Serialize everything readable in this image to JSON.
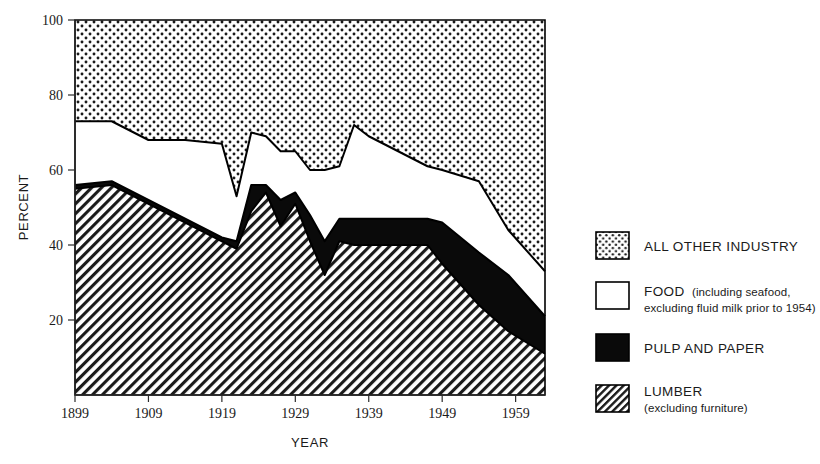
{
  "chart_data": {
    "type": "area",
    "stacked": true,
    "stack_total": 100,
    "title": "",
    "subtitle": "",
    "xlabel": "YEAR",
    "ylabel": "PERCENT",
    "xlim": [
      1899,
      1963
    ],
    "ylim": [
      0,
      100
    ],
    "xticks": [
      1899,
      1909,
      1919,
      1929,
      1939,
      1949,
      1959
    ],
    "xtick_labels": [
      "1899",
      "1909",
      "1919",
      "1929",
      "1939",
      "1949",
      "1959"
    ],
    "yticks": [
      20,
      40,
      60,
      80,
      100
    ],
    "ytick_labels": [
      "20",
      "40",
      "60",
      "80",
      "100"
    ],
    "grid": false,
    "legend_position": "right",
    "x": [
      1899,
      1904,
      1909,
      1914,
      1919,
      1921,
      1923,
      1925,
      1927,
      1929,
      1931,
      1933,
      1935,
      1937,
      1939,
      1947,
      1949,
      1954,
      1958,
      1963
    ],
    "series": [
      {
        "name": "LUMBER",
        "fill": "diagonal-hatch",
        "values": [
          55,
          56,
          51,
          46,
          41,
          39,
          49,
          54,
          45,
          51,
          41,
          32,
          41,
          40,
          40,
          40,
          35,
          24,
          17,
          11
        ]
      },
      {
        "name": "PULP AND PAPER",
        "fill": "solid-black",
        "values": [
          1,
          1,
          1,
          1,
          1,
          2,
          7,
          2,
          7,
          3,
          7,
          9,
          6,
          7,
          7,
          7,
          11,
          14,
          15,
          10
        ]
      },
      {
        "name": "FOOD",
        "fill": "white",
        "values": [
          17,
          16,
          16,
          21,
          25,
          12,
          14,
          13,
          13,
          11,
          12,
          19,
          14,
          25,
          22,
          14,
          14,
          19,
          12,
          12
        ]
      },
      {
        "name": "ALL OTHER INDUSTRY",
        "fill": "dotted",
        "values": [
          27,
          27,
          32,
          32,
          33,
          47,
          30,
          31,
          35,
          35,
          40,
          40,
          39,
          28,
          31,
          39,
          40,
          43,
          56,
          67
        ]
      }
    ],
    "cumulative_top_boundaries": {
      "lumber_top": [
        55,
        56,
        51,
        46,
        41,
        39,
        49,
        54,
        45,
        51,
        41,
        32,
        41,
        40,
        40,
        40,
        35,
        24,
        17,
        11
      ],
      "pulp_top": [
        56,
        57,
        52,
        47,
        42,
        41,
        56,
        56,
        52,
        54,
        48,
        41,
        47,
        47,
        47,
        47,
        46,
        38,
        32,
        21
      ],
      "food_top": [
        73,
        73,
        68,
        68,
        67,
        53,
        70,
        69,
        65,
        65,
        60,
        60,
        61,
        72,
        69,
        61,
        60,
        57,
        44,
        33
      ]
    }
  },
  "legend": {
    "items": [
      {
        "key": "all-other-industry",
        "swatch": "dotted",
        "label": "ALL OTHER  INDUSTRY",
        "sub": ""
      },
      {
        "key": "food",
        "swatch": "white",
        "label": "FOOD",
        "sub": "(including seafood,",
        "sub2": "excluding  fluid milk prior to 1954)"
      },
      {
        "key": "pulp-and-paper",
        "swatch": "solid-black",
        "label": "PULP  AND  PAPER",
        "sub": ""
      },
      {
        "key": "lumber",
        "swatch": "diagonal-hatch",
        "label": "LUMBER",
        "sub": "(excluding furniture)"
      }
    ]
  },
  "colors": {
    "ink": "#000000",
    "background": "#ffffff",
    "pulp_fill": "#0a0a0a",
    "food_fill": "#ffffff",
    "hatch_stroke": "#1a1a1a",
    "dot_fill": "#1a1a1a"
  }
}
